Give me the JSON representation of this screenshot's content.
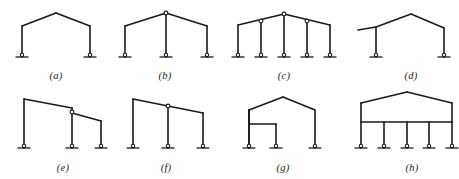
{
  "figure": {
    "width": 459,
    "height": 179,
    "background_color": "#ffffff",
    "line_color": "#1a1a1a",
    "support_color": "#1a1a1a",
    "member_stroke_width": 1.6,
    "ground_stroke_width": 1.3,
    "joint_radius": 1.9,
    "support_pin_radius": 1.7,
    "support_base_halfwidth": 6.5
  },
  "captions": [
    {
      "id": "a",
      "label": "(a)",
      "x": 56,
      "y": 70
    },
    {
      "id": "b",
      "label": "(b)",
      "x": 165,
      "y": 70
    },
    {
      "id": "c",
      "label": "(c)",
      "x": 284,
      "y": 70
    },
    {
      "id": "d",
      "label": "(d)",
      "x": 411,
      "y": 70
    },
    {
      "id": "e",
      "label": "(e)",
      "x": 63,
      "y": 162
    },
    {
      "id": "f",
      "label": "(f)",
      "x": 166,
      "y": 162
    },
    {
      "id": "g",
      "label": "(g)",
      "x": 283,
      "y": 162
    },
    {
      "id": "h",
      "label": "(h)",
      "x": 412,
      "y": 162
    }
  ],
  "frames": [
    {
      "id": "a",
      "name": "single-bay-gable-frame",
      "description": "Single bay pinned-base gable portal frame",
      "base_y": 57,
      "members": [
        {
          "name": "left-column",
          "points": [
            [
              22,
              57
            ],
            [
              22,
              26
            ]
          ]
        },
        {
          "name": "right-column",
          "points": [
            [
              90,
              57
            ],
            [
              90,
              26
            ]
          ]
        },
        {
          "name": "left-rafter",
          "points": [
            [
              22,
              26
            ],
            [
              56,
              13
            ]
          ]
        },
        {
          "name": "right-rafter",
          "points": [
            [
              56,
              13
            ],
            [
              90,
              26
            ]
          ]
        }
      ],
      "joints": [],
      "supports": [
        {
          "name": "support-left",
          "x": 22,
          "y": 57
        },
        {
          "name": "support-right",
          "x": 90,
          "y": 57
        }
      ]
    },
    {
      "id": "b",
      "name": "two-bay-gable-frame-center-column",
      "description": "Two bay gable frame with center column to apex",
      "base_y": 57,
      "members": [
        {
          "name": "left-column",
          "points": [
            [
              125,
              57
            ],
            [
              125,
              26
            ]
          ]
        },
        {
          "name": "center-column",
          "points": [
            [
              166,
              57
            ],
            [
              166,
              13
            ]
          ]
        },
        {
          "name": "right-column",
          "points": [
            [
              207,
              57
            ],
            [
              207,
              26
            ]
          ]
        },
        {
          "name": "left-rafter",
          "points": [
            [
              125,
              26
            ],
            [
              166,
              13
            ]
          ]
        },
        {
          "name": "right-rafter",
          "points": [
            [
              166,
              13
            ],
            [
              207,
              26
            ]
          ]
        }
      ],
      "joints": [
        {
          "name": "apex-pin",
          "x": 166,
          "y": 13
        }
      ],
      "supports": [
        {
          "name": "support-left",
          "x": 125,
          "y": 57
        },
        {
          "name": "support-center",
          "x": 166,
          "y": 57
        },
        {
          "name": "support-right",
          "x": 207,
          "y": 57
        }
      ]
    },
    {
      "id": "c",
      "name": "four-bay-gable-frame-multiple-columns",
      "description": "Multi bay gable frame with five pinned columns",
      "base_y": 57,
      "members": [
        {
          "name": "column-1",
          "points": [
            [
              238,
              57
            ],
            [
              238,
              25
            ]
          ]
        },
        {
          "name": "column-2",
          "points": [
            [
              261,
              57
            ],
            [
              261,
              21
            ]
          ]
        },
        {
          "name": "column-3",
          "points": [
            [
              284,
              57
            ],
            [
              284,
              14
            ]
          ]
        },
        {
          "name": "column-4",
          "points": [
            [
              307,
              57
            ],
            [
              307,
              21
            ]
          ]
        },
        {
          "name": "column-5",
          "points": [
            [
              330,
              57
            ],
            [
              330,
              25
            ]
          ]
        },
        {
          "name": "left-rafter",
          "points": [
            [
              238,
              25
            ],
            [
              284,
              14
            ]
          ]
        },
        {
          "name": "right-rafter",
          "points": [
            [
              284,
              14
            ],
            [
              330,
              25
            ]
          ]
        }
      ],
      "joints": [
        {
          "name": "joint-column-2-top",
          "x": 261,
          "y": 21
        },
        {
          "name": "apex-pin",
          "x": 284,
          "y": 14
        },
        {
          "name": "joint-column-4-top",
          "x": 307,
          "y": 21
        }
      ],
      "supports": [
        {
          "name": "support-1",
          "x": 238,
          "y": 57
        },
        {
          "name": "support-2",
          "x": 261,
          "y": 57
        },
        {
          "name": "support-3",
          "x": 284,
          "y": 57
        },
        {
          "name": "support-4",
          "x": 307,
          "y": 57
        },
        {
          "name": "support-5",
          "x": 330,
          "y": 57
        }
      ]
    },
    {
      "id": "d",
      "name": "gable-frame-with-left-overhang",
      "description": "Gable frame with cantilever overhang at left eave",
      "base_y": 57,
      "members": [
        {
          "name": "left-column",
          "points": [
            [
              376,
              57
            ],
            [
              376,
              27
            ]
          ]
        },
        {
          "name": "right-column",
          "points": [
            [
              444,
              57
            ],
            [
              444,
              28
            ]
          ]
        },
        {
          "name": "left-overhang",
          "points": [
            [
              358,
              30
            ],
            [
              376,
              27
            ]
          ]
        },
        {
          "name": "left-rafter",
          "points": [
            [
              376,
              27
            ],
            [
              411,
              14
            ]
          ]
        },
        {
          "name": "right-rafter",
          "points": [
            [
              411,
              14
            ],
            [
              444,
              28
            ]
          ]
        }
      ],
      "joints": [],
      "supports": [
        {
          "name": "support-left",
          "x": 376,
          "y": 57
        },
        {
          "name": "support-right",
          "x": 444,
          "y": 57
        }
      ]
    },
    {
      "id": "e",
      "name": "stepped-shed-frame",
      "description": "Stepped frame with tall left bay and lower right bay, sloped roofs",
      "base_y": 148,
      "members": [
        {
          "name": "left-column",
          "points": [
            [
              24,
              148
            ],
            [
              24,
              99
            ]
          ]
        },
        {
          "name": "mid-column",
          "points": [
            [
              72,
              148
            ],
            [
              72,
              113
            ]
          ]
        },
        {
          "name": "right-column",
          "points": [
            [
              101,
              148
            ],
            [
              101,
              121
            ]
          ]
        },
        {
          "name": "upper-rafter",
          "points": [
            [
              24,
              99
            ],
            [
              72,
              108
            ]
          ]
        },
        {
          "name": "step-riser",
          "points": [
            [
              72,
              108
            ],
            [
              72,
              113
            ]
          ]
        },
        {
          "name": "lower-rafter",
          "points": [
            [
              72,
              113
            ],
            [
              101,
              121
            ]
          ]
        }
      ],
      "joints": [
        {
          "name": "step-joint",
          "x": 72,
          "y": 112
        }
      ],
      "supports": [
        {
          "name": "support-left",
          "x": 24,
          "y": 148
        },
        {
          "name": "support-mid",
          "x": 72,
          "y": 148
        },
        {
          "name": "support-right",
          "x": 101,
          "y": 148
        }
      ]
    },
    {
      "id": "f",
      "name": "two-bay-sloped-shed-frame",
      "description": "Two bay shed frame with continuous sloping roof and center column",
      "base_y": 148,
      "members": [
        {
          "name": "left-column",
          "points": [
            [
              133,
              148
            ],
            [
              133,
              99
            ]
          ]
        },
        {
          "name": "center-column",
          "points": [
            [
              168,
              148
            ],
            [
              168,
              106
            ]
          ]
        },
        {
          "name": "right-column",
          "points": [
            [
              203,
              148
            ],
            [
              203,
              113
            ]
          ]
        },
        {
          "name": "roof-beam",
          "points": [
            [
              133,
              99
            ],
            [
              203,
              113
            ]
          ]
        }
      ],
      "joints": [
        {
          "name": "center-column-top-joint",
          "x": 168,
          "y": 106
        }
      ],
      "supports": [
        {
          "name": "support-left",
          "x": 133,
          "y": 148
        },
        {
          "name": "support-center",
          "x": 168,
          "y": 148
        },
        {
          "name": "support-right",
          "x": 203,
          "y": 148
        }
      ]
    },
    {
      "id": "g",
      "name": "gable-frame-with-low-side-bay",
      "description": "Gable frame with short interior column and low horizontal tie at left",
      "base_y": 148,
      "members": [
        {
          "name": "left-column",
          "points": [
            [
              249,
              148
            ],
            [
              249,
              110
            ]
          ]
        },
        {
          "name": "left-upper-column",
          "points": [
            [
              249,
              110
            ],
            [
              249,
              110
            ]
          ]
        },
        {
          "name": "left-column-upper",
          "points": [
            [
              249,
              110
            ],
            [
              249,
              110
            ]
          ]
        },
        {
          "name": "left-main-column",
          "points": [
            [
              249,
              110
            ],
            [
              249,
              110
            ]
          ]
        },
        {
          "name": "left-tall-column",
          "points": [
            [
              249,
              110
            ],
            [
              249,
              110
            ]
          ]
        },
        {
          "name": "left-column-full",
          "points": [
            [
              249,
              148
            ],
            [
              249,
              110
            ]
          ]
        },
        {
          "name": "left-column-top",
          "points": [
            [
              249,
              110
            ],
            [
              249,
              110
            ]
          ]
        },
        {
          "name": "low-tie-beam",
          "points": [
            [
              249,
              124
            ],
            [
              276,
              124
            ]
          ]
        },
        {
          "name": "short-column",
          "points": [
            [
              276,
              124
            ],
            [
              276,
              148
            ]
          ]
        },
        {
          "name": "left-column-upper-part",
          "points": [
            [
              249,
              124
            ],
            [
              249,
              110
            ]
          ]
        },
        {
          "name": "right-column",
          "points": [
            [
              315,
              148
            ],
            [
              315,
              110
            ]
          ]
        },
        {
          "name": "left-rafter",
          "points": [
            [
              249,
              110
            ],
            [
              283,
              97
            ]
          ]
        },
        {
          "name": "right-rafter",
          "points": [
            [
              283,
              97
            ],
            [
              315,
              110
            ]
          ]
        }
      ],
      "joints": [],
      "supports": [
        {
          "name": "support-left",
          "x": 249,
          "y": 148
        },
        {
          "name": "support-mid",
          "x": 276,
          "y": 148
        },
        {
          "name": "support-right",
          "x": 315,
          "y": 148
        }
      ]
    },
    {
      "id": "h",
      "name": "gable-roof-frame-on-tie-beam",
      "description": "Gabled roof truss frame over horizontal tie beam supported on five columns",
      "base_y": 148,
      "members": [
        {
          "name": "left-column-upper",
          "points": [
            [
              361,
              122
            ],
            [
              361,
              103
            ]
          ]
        },
        {
          "name": "right-column-upper",
          "points": [
            [
              452,
              122
            ],
            [
              452,
              103
            ]
          ]
        },
        {
          "name": "left-rafter",
          "points": [
            [
              361,
              103
            ],
            [
              407,
              92
            ]
          ]
        },
        {
          "name": "right-rafter",
          "points": [
            [
              407,
              92
            ],
            [
              452,
              103
            ]
          ]
        },
        {
          "name": "tie-beam",
          "points": [
            [
              361,
              122
            ],
            [
              452,
              122
            ]
          ]
        },
        {
          "name": "column-1",
          "points": [
            [
              361,
              122
            ],
            [
              361,
              148
            ]
          ]
        },
        {
          "name": "column-2",
          "points": [
            [
              384,
              122
            ],
            [
              384,
              148
            ]
          ]
        },
        {
          "name": "column-3",
          "points": [
            [
              407,
              122
            ],
            [
              407,
              148
            ]
          ]
        },
        {
          "name": "column-4",
          "points": [
            [
              429,
              122
            ],
            [
              429,
              148
            ]
          ]
        },
        {
          "name": "column-5",
          "points": [
            [
              452,
              122
            ],
            [
              452,
              148
            ]
          ]
        }
      ],
      "joints": [],
      "supports": [
        {
          "name": "support-1",
          "x": 361,
          "y": 148
        },
        {
          "name": "support-2",
          "x": 384,
          "y": 148
        },
        {
          "name": "support-3",
          "x": 407,
          "y": 148
        },
        {
          "name": "support-4",
          "x": 429,
          "y": 148
        },
        {
          "name": "support-5",
          "x": 452,
          "y": 148
        }
      ]
    }
  ]
}
